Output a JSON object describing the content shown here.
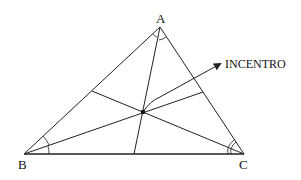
{
  "diagram": {
    "vertices": [
      {
        "id": "A",
        "label": "A",
        "x": 160,
        "y": 27
      },
      {
        "id": "B",
        "label": "B",
        "x": 24,
        "y": 154
      },
      {
        "id": "C",
        "label": "C",
        "x": 244,
        "y": 154
      }
    ],
    "bisector_feet": {
      "from_A_on_BC": {
        "x": 134,
        "y": 154
      },
      "from_B_on_AC": {
        "x": 203,
        "y": 92
      },
      "from_C_on_AB": {
        "x": 92,
        "y": 91
      }
    },
    "incenter": {
      "x": 143,
      "y": 112,
      "label": "INCENTRO"
    },
    "annotation": {
      "text": "INCENTRO",
      "arrow_tip": {
        "x": 222,
        "y": 63
      }
    },
    "colors": {
      "stroke": "#222222",
      "background": "#ffffff"
    }
  }
}
